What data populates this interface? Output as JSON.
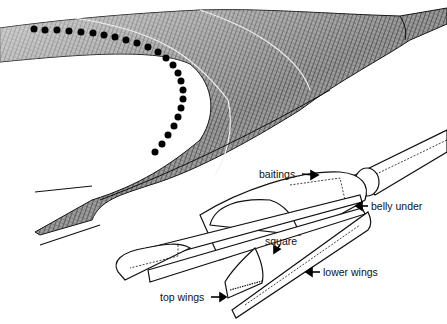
{
  "diagram": {
    "views": [
      {
        "name": "perspective-net",
        "style": "cross-hatched mesh with float line"
      },
      {
        "name": "exploded-panels",
        "style": "line drawing"
      }
    ],
    "labels": [
      {
        "id": "baitings",
        "text": "baitings",
        "x": 259,
        "y": 168
      },
      {
        "id": "belly-under",
        "text": "belly under",
        "x": 371,
        "y": 200
      },
      {
        "id": "square",
        "text": "square",
        "x": 265,
        "y": 236
      },
      {
        "id": "lower-wings",
        "text": "lower wings",
        "x": 323,
        "y": 266
      },
      {
        "id": "top-wings",
        "text": "top wings",
        "x": 160,
        "y": 292
      }
    ],
    "colors": {
      "ink": "#111111",
      "paper": "#ffffff",
      "mesh_light": "#d8d8d8",
      "mesh_dark": "#444444"
    }
  }
}
